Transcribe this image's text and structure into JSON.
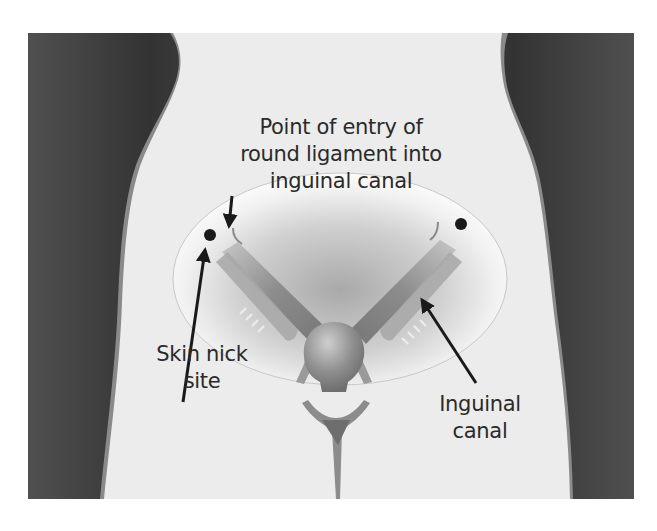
{
  "figure": {
    "type": "anatomical-illustration",
    "colors": {
      "background_dark": "#3a3a3a",
      "background_dark_edge": "#606060",
      "body_skin": "#ececec",
      "highlight_ellipse": "#f8f8f8",
      "ellipse_inner_shade": "#b8b8b8",
      "organ_gray": "#8a8a8a",
      "organ_dark": "#6a6a6a",
      "text": "#2a2a2a",
      "marker": "#1a1a1a"
    }
  },
  "labels": {
    "entry_point": {
      "lines": [
        "Point of entry of",
        "round ligament into",
        "inguinal canal"
      ]
    },
    "skin_nick": {
      "lines": [
        "Skin nick",
        "site"
      ]
    },
    "inguinal_canal": {
      "lines": [
        "Inguinal",
        "canal"
      ]
    }
  },
  "markers": [
    {
      "name": "left-skin-nick-dot",
      "x": 210,
      "y": 235
    },
    {
      "name": "right-skin-nick-dot",
      "x": 461,
      "y": 224
    }
  ],
  "arrows": [
    {
      "name": "entry-point-arrow",
      "from": [
        232,
        196
      ],
      "to": [
        229,
        228
      ]
    },
    {
      "name": "skin-nick-arrow",
      "from": [
        183,
        402
      ],
      "to": [
        205,
        248
      ]
    },
    {
      "name": "inguinal-canal-arrow",
      "from": [
        476,
        383
      ],
      "to": [
        421,
        298
      ]
    }
  ]
}
